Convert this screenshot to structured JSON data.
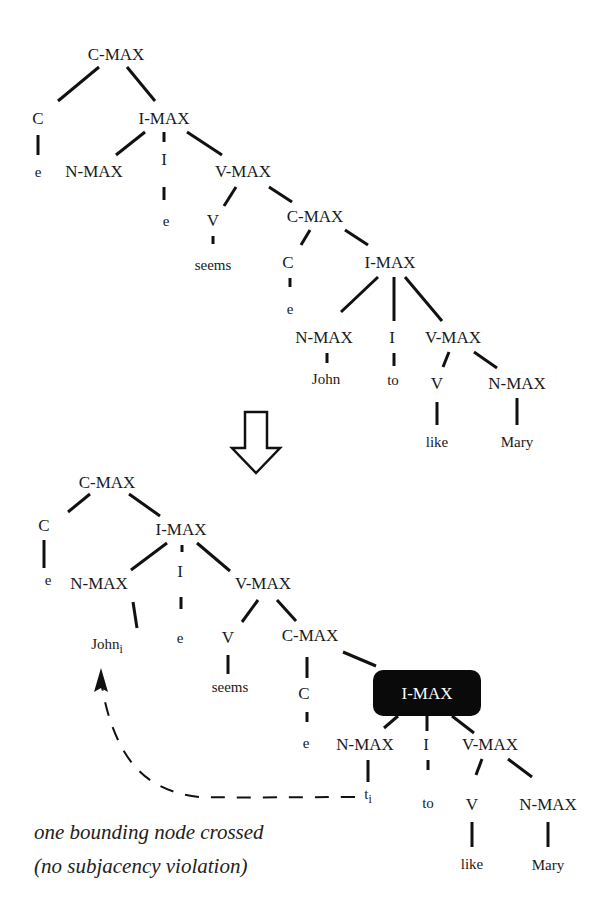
{
  "colors": {
    "ink": "#111111",
    "highlight_fill": "#0a0a0a",
    "highlight_text": "#ffffff",
    "background": "#ffffff"
  },
  "top_tree": {
    "nodes": [
      {
        "id": "t_cmax",
        "label": "C-MAX",
        "x": 116,
        "y": 60,
        "cls": "node"
      },
      {
        "id": "t_c",
        "label": "C",
        "x": 38,
        "y": 124,
        "cls": "node"
      },
      {
        "id": "t_c_e",
        "label": "e",
        "x": 38,
        "y": 177,
        "cls": "leaf"
      },
      {
        "id": "t_imax",
        "label": "I-MAX",
        "x": 164,
        "y": 124,
        "cls": "node"
      },
      {
        "id": "t_nmax",
        "label": "N-MAX",
        "x": 94,
        "y": 177,
        "cls": "node"
      },
      {
        "id": "t_i",
        "label": "I",
        "x": 164,
        "y": 165,
        "cls": "node"
      },
      {
        "id": "t_i_e",
        "label": "e",
        "x": 166,
        "y": 226,
        "cls": "leaf"
      },
      {
        "id": "t_vmax",
        "label": "V-MAX",
        "x": 243,
        "y": 177,
        "cls": "node"
      },
      {
        "id": "t_v",
        "label": "V",
        "x": 213,
        "y": 226,
        "cls": "node"
      },
      {
        "id": "t_seems",
        "label": "seems",
        "x": 213,
        "y": 270,
        "cls": "leaf"
      },
      {
        "id": "t_cmax2",
        "label": "C-MAX",
        "x": 315,
        "y": 222,
        "cls": "node"
      },
      {
        "id": "t_c2",
        "label": "C",
        "x": 288,
        "y": 268,
        "cls": "node"
      },
      {
        "id": "t_c2_e",
        "label": "e",
        "x": 290,
        "y": 314,
        "cls": "leaf"
      },
      {
        "id": "t_imax2",
        "label": "I-MAX",
        "x": 390,
        "y": 268,
        "cls": "node"
      },
      {
        "id": "t_nmax2",
        "label": "N-MAX",
        "x": 324,
        "y": 343,
        "cls": "node"
      },
      {
        "id": "t_john",
        "label": "John",
        "x": 326,
        "y": 384,
        "cls": "leaf"
      },
      {
        "id": "t_i2",
        "label": "I",
        "x": 392,
        "y": 343,
        "cls": "node"
      },
      {
        "id": "t_to",
        "label": "to",
        "x": 393,
        "y": 385,
        "cls": "leaf"
      },
      {
        "id": "t_vmax2",
        "label": "V-MAX",
        "x": 453,
        "y": 343,
        "cls": "node"
      },
      {
        "id": "t_v2",
        "label": "V",
        "x": 437,
        "y": 389,
        "cls": "node"
      },
      {
        "id": "t_like",
        "label": "like",
        "x": 437,
        "y": 447,
        "cls": "leaf"
      },
      {
        "id": "t_nmax3",
        "label": "N-MAX",
        "x": 517,
        "y": 389,
        "cls": "node"
      },
      {
        "id": "t_mary",
        "label": "Mary",
        "x": 517,
        "y": 447,
        "cls": "leaf"
      }
    ],
    "edges": [
      [
        99,
        67,
        58,
        101
      ],
      [
        127,
        67,
        155,
        101
      ],
      [
        38,
        135,
        38,
        155
      ],
      [
        145,
        132,
        116,
        155
      ],
      [
        164,
        132,
        164,
        142
      ],
      [
        187,
        132,
        222,
        155
      ],
      [
        164,
        187,
        164,
        200
      ],
      [
        236,
        187,
        224,
        206
      ],
      [
        269,
        187,
        292,
        202
      ],
      [
        213,
        236,
        213,
        244
      ],
      [
        310,
        230,
        301,
        245
      ],
      [
        345,
        230,
        368,
        245
      ],
      [
        290,
        278,
        290,
        287
      ],
      [
        378,
        277,
        341,
        312
      ],
      [
        394,
        277,
        394,
        321
      ],
      [
        405,
        277,
        442,
        321
      ],
      [
        327,
        353,
        327,
        363
      ],
      [
        394,
        353,
        394,
        366
      ],
      [
        449,
        352,
        443,
        367
      ],
      [
        474,
        352,
        497,
        368
      ],
      [
        437,
        402,
        437,
        425
      ],
      [
        517,
        398,
        517,
        425
      ]
    ]
  },
  "transform_arrow": {
    "label": "derives",
    "points": "245,412 267,412 267,448 280,448 256,473 232,448 245,448"
  },
  "bottom_tree": {
    "nodes": [
      {
        "id": "b_cmax",
        "label": "C-MAX",
        "x": 107,
        "y": 488,
        "cls": "node"
      },
      {
        "id": "b_c",
        "label": "C",
        "x": 44,
        "y": 531,
        "cls": "node"
      },
      {
        "id": "b_c_e",
        "label": "e",
        "x": 48,
        "y": 585,
        "cls": "leaf"
      },
      {
        "id": "b_imax",
        "label": "I-MAX",
        "x": 181,
        "y": 535,
        "cls": "node"
      },
      {
        "id": "b_nmax",
        "label": "N-MAX",
        "x": 99,
        "y": 589,
        "cls": "node"
      },
      {
        "id": "b_john",
        "label": "John",
        "x": 107,
        "y": 649,
        "cls": "leaf",
        "sub": "i"
      },
      {
        "id": "b_i",
        "label": "I",
        "x": 180,
        "y": 577,
        "cls": "node"
      },
      {
        "id": "b_i_e",
        "label": "e",
        "x": 180,
        "y": 643,
        "cls": "leaf"
      },
      {
        "id": "b_vmax",
        "label": "V-MAX",
        "x": 263,
        "y": 589,
        "cls": "node"
      },
      {
        "id": "b_v",
        "label": "V",
        "x": 228,
        "y": 643,
        "cls": "node"
      },
      {
        "id": "b_seems",
        "label": "seems",
        "x": 230,
        "y": 692,
        "cls": "leaf"
      },
      {
        "id": "b_cmax2",
        "label": "C-MAX",
        "x": 310,
        "y": 641,
        "cls": "node"
      },
      {
        "id": "b_c2",
        "label": "C",
        "x": 304,
        "y": 699,
        "cls": "node"
      },
      {
        "id": "b_c2_e",
        "label": "e",
        "x": 306,
        "y": 748,
        "cls": "leaf"
      },
      {
        "id": "b_nmax2",
        "label": "N-MAX",
        "x": 365,
        "y": 750,
        "cls": "node"
      },
      {
        "id": "b_ti",
        "label": "t",
        "x": 368,
        "y": 799,
        "cls": "leaf",
        "sub": "i"
      },
      {
        "id": "b_i2",
        "label": "I",
        "x": 426,
        "y": 750,
        "cls": "node"
      },
      {
        "id": "b_to",
        "label": "to",
        "x": 428,
        "y": 808,
        "cls": "leaf"
      },
      {
        "id": "b_vmax2",
        "label": "V-MAX",
        "x": 490,
        "y": 750,
        "cls": "node"
      },
      {
        "id": "b_v2",
        "label": "V",
        "x": 472,
        "y": 810,
        "cls": "node"
      },
      {
        "id": "b_like",
        "label": "like",
        "x": 472,
        "y": 869,
        "cls": "leaf"
      },
      {
        "id": "b_nmax3",
        "label": "N-MAX",
        "x": 548,
        "y": 810,
        "cls": "node"
      },
      {
        "id": "b_mary",
        "label": "Mary",
        "x": 548,
        "y": 870,
        "cls": "leaf"
      }
    ],
    "highlighted": {
      "label": "I-MAX",
      "x": 373,
      "y": 670,
      "width": 108,
      "height": 46,
      "rx": 10,
      "text_x": 427,
      "text_y": 699
    },
    "edges": [
      [
        90,
        494,
        68,
        512
      ],
      [
        129,
        494,
        160,
        516
      ],
      [
        44,
        540,
        44,
        568
      ],
      [
        167,
        543,
        131,
        570
      ],
      [
        182,
        545,
        182,
        552
      ],
      [
        197,
        543,
        230,
        571
      ],
      [
        181,
        597,
        181,
        609
      ],
      [
        133,
        602,
        137,
        628
      ],
      [
        258,
        600,
        242,
        622
      ],
      [
        277,
        600,
        296,
        621
      ],
      [
        228,
        655,
        228,
        674
      ],
      [
        307,
        657,
        307,
        678
      ],
      [
        343,
        652,
        376,
        666
      ],
      [
        307,
        712,
        307,
        722
      ],
      [
        398,
        716,
        384,
        728
      ],
      [
        427,
        716,
        427,
        731
      ],
      [
        452,
        716,
        474,
        733
      ],
      [
        368,
        760,
        368,
        782
      ],
      [
        428,
        760,
        428,
        770
      ],
      [
        482,
        759,
        476,
        775
      ],
      [
        508,
        759,
        532,
        777
      ],
      [
        472,
        822,
        472,
        847
      ],
      [
        548,
        822,
        548,
        847
      ]
    ],
    "movement_path": "M 355 797 C 300 797, 250 798, 200 797 C 150 792, 130 765, 118 740 C 108 718, 104 700, 101 680",
    "movement_arrowhead": "101,668 94,692 101,688 108,692"
  },
  "caption": {
    "line1": "one bounding node crossed",
    "line2": "(no subjacency violation)",
    "x": 34,
    "y1": 839,
    "y2": 873
  }
}
